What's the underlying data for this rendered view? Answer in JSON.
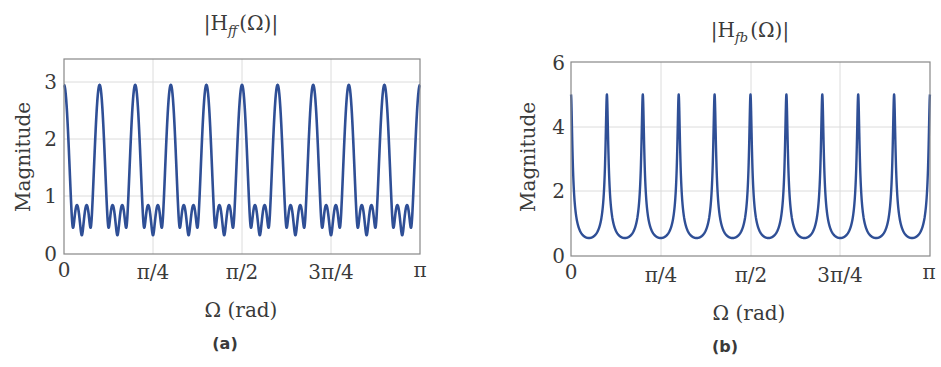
{
  "figure": {
    "panels": [
      {
        "id": "a",
        "caption": "(a)",
        "title": "|H_ff(Ω)|",
        "title_main": "|H",
        "title_sub": "ff",
        "title_tail": "(Ω)|",
        "xlabel": "Ω (rad)",
        "ylabel": "Magnitude",
        "xticks": [
          "0",
          "π/4",
          "π/2",
          "3π/4",
          "π"
        ],
        "yticks": [
          "0",
          "1",
          "2",
          "3"
        ],
        "line_color": "#2f4f96"
      },
      {
        "id": "b",
        "caption": "(b)",
        "title": "|H_fb(Ω)|",
        "title_main": "|H",
        "title_sub": "fb",
        "title_tail": "(Ω)|",
        "xlabel": "Ω (rad)",
        "ylabel": "Magnitude",
        "xticks": [
          "0",
          "π/4",
          "π/2",
          "3π/4",
          "π"
        ],
        "yticks": [
          "0",
          "2",
          "4",
          "6"
        ],
        "line_color": "#2f4f96"
      }
    ]
  },
  "chart_data": [
    {
      "type": "line",
      "title": "|H_ff(Ω)|",
      "xlabel": "Ω (rad)",
      "ylabel": "Magnitude",
      "xlim": [
        0,
        3.14159
      ],
      "ylim": [
        0,
        3.4
      ],
      "x_tick_labels": [
        "0",
        "π/4",
        "π/2",
        "3π/4",
        "π"
      ],
      "y_tick_labels": [
        "0",
        "1",
        "2",
        "3"
      ],
      "grid": true,
      "description": "Feed-forward comb magnitude |Σ_{k=0}^{3} 0.8^k e^{-jk·20Ω}|; 10 periods over [0, π], main peaks ≈2.95 at Ω = kπ/10, between peaks three dips (≈0.45, ≈0.3, ≈0.45) separated by two side lobes ≈0.85",
      "series": [
        {
          "name": "|H_ff(Ω)|",
          "x": [
            0,
            0.0157,
            0.0314,
            0.0471,
            0.0628,
            0.0785,
            0.0942,
            0.11,
            0.1257,
            0.1414,
            0.1571,
            0.1728,
            0.1885,
            0.2042,
            0.2199,
            0.2356,
            0.2513,
            0.267,
            0.2827,
            0.2985,
            0.3142
          ],
          "y": [
            2.95,
            2.41,
            1.4,
            0.64,
            0.45,
            0.72,
            0.85,
            0.65,
            0.38,
            0.3,
            0.38,
            0.65,
            0.85,
            0.72,
            0.45,
            0.64,
            1.4,
            2.41,
            2.95,
            2.41,
            2.95
          ]
        }
      ],
      "peaks": {
        "x": [
          0,
          0.314,
          0.628,
          0.942,
          1.257,
          1.571,
          1.885,
          2.199,
          2.513,
          2.827,
          3.142
        ],
        "y": 2.95
      }
    },
    {
      "type": "line",
      "title": "|H_fb(Ω)|",
      "xlabel": "Ω (rad)",
      "ylabel": "Magnitude",
      "xlim": [
        0,
        3.14159
      ],
      "ylim": [
        0,
        6
      ],
      "x_tick_labels": [
        "0",
        "π/4",
        "π/2",
        "3π/4",
        "π"
      ],
      "y_tick_labels": [
        "0",
        "2",
        "4",
        "6"
      ],
      "grid": true,
      "description": "Feedback comb magnitude 1/|1 - 0.8 e^{-j·20Ω}|; 10 periods over [0, π], sharp peaks of 5 at Ω = kπ/10, valley minima ≈0.56 midway between peaks",
      "series": [
        {
          "name": "|H_fb(Ω)|",
          "x": [
            0,
            0.0157,
            0.0314,
            0.0471,
            0.0785,
            0.11,
            0.1571,
            0.2042,
            0.2356,
            0.267,
            0.2985,
            0.3142
          ],
          "y": [
            5.0,
            1.51,
            0.93,
            0.72,
            0.6,
            0.57,
            0.56,
            0.57,
            0.6,
            0.93,
            1.51,
            5.0
          ]
        }
      ],
      "peaks": {
        "x": [
          0,
          0.314,
          0.628,
          0.942,
          1.257,
          1.571,
          1.885,
          2.199,
          2.513,
          2.827,
          3.142
        ],
        "y": 5.0
      },
      "valley_min": 0.556
    }
  ]
}
